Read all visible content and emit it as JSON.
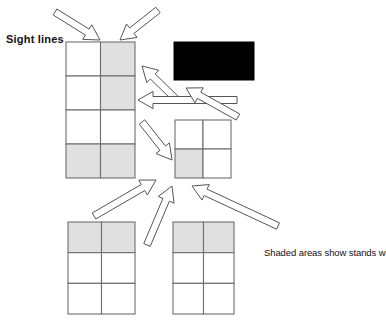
{
  "diagram": {
    "title_label": "Sight lines",
    "caption": "Shaded areas show stands with good sight lines for visitors and exhibitors",
    "colors": {
      "shaded_fill": "#e0e0e0",
      "unshaded_fill": "#ffffff",
      "grid_stroke": "#6e6e6e",
      "arrow_stroke": "#555555",
      "arrow_fill": "#ffffff",
      "screen_fill": "#000000",
      "text": "#111111"
    },
    "grids": [
      {
        "name": "stand-block-upper-left",
        "x": 66,
        "y": 42,
        "width": 69,
        "height": 136,
        "cols": 2,
        "rows": 4,
        "shaded_cells": [
          [
            0,
            1
          ],
          [
            1,
            1
          ],
          [
            3,
            0
          ],
          [
            3,
            1
          ]
        ]
      },
      {
        "name": "stand-block-middle-right",
        "x": 175,
        "y": 120,
        "width": 56,
        "height": 58,
        "cols": 2,
        "rows": 2,
        "shaded_cells": [
          [
            1,
            0
          ]
        ]
      },
      {
        "name": "stand-block-lower-left",
        "x": 68,
        "y": 222,
        "width": 67,
        "height": 92,
        "cols": 2,
        "rows": 3,
        "shaded_cells": [
          [
            0,
            0
          ],
          [
            0,
            1
          ]
        ]
      },
      {
        "name": "stand-block-lower-right",
        "x": 173,
        "y": 222,
        "width": 61,
        "height": 92,
        "cols": 2,
        "rows": 3,
        "shaded_cells": [
          [
            0,
            0
          ],
          [
            0,
            1
          ]
        ]
      }
    ],
    "screen": {
      "name": "display-screen",
      "x": 174,
      "y": 42,
      "width": 80,
      "height": 38
    },
    "arrows": [
      {
        "name": "arrow-top-left-inbound",
        "x1": 55,
        "y1": 12,
        "x2": 100,
        "y2": 40,
        "width": 7
      },
      {
        "name": "arrow-top-right-inbound",
        "x1": 158,
        "y1": 10,
        "x2": 120,
        "y2": 40,
        "width": 7
      },
      {
        "name": "arrow-screen-to-upper-left-block",
        "x1": 176,
        "y1": 99,
        "x2": 142,
        "y2": 66,
        "width": 7
      },
      {
        "name": "arrow-horizontal-to-left-block",
        "x1": 237,
        "y1": 100,
        "x2": 138,
        "y2": 100,
        "width": 7
      },
      {
        "name": "arrow-middle-right-to-screen-area",
        "x1": 238,
        "y1": 117,
        "x2": 186,
        "y2": 88,
        "width": 7
      },
      {
        "name": "arrow-left-block-to-middle-right",
        "x1": 142,
        "y1": 122,
        "x2": 172,
        "y2": 160,
        "width": 7
      },
      {
        "name": "arrow-lower-left-to-left-block",
        "x1": 94,
        "y1": 216,
        "x2": 156,
        "y2": 180,
        "width": 7
      },
      {
        "name": "arrow-lower-center-up",
        "x1": 147,
        "y1": 245,
        "x2": 172,
        "y2": 186,
        "width": 7
      },
      {
        "name": "arrow-lower-right-to-middle-right",
        "x1": 278,
        "y1": 226,
        "x2": 192,
        "y2": 186,
        "width": 7
      }
    ]
  }
}
